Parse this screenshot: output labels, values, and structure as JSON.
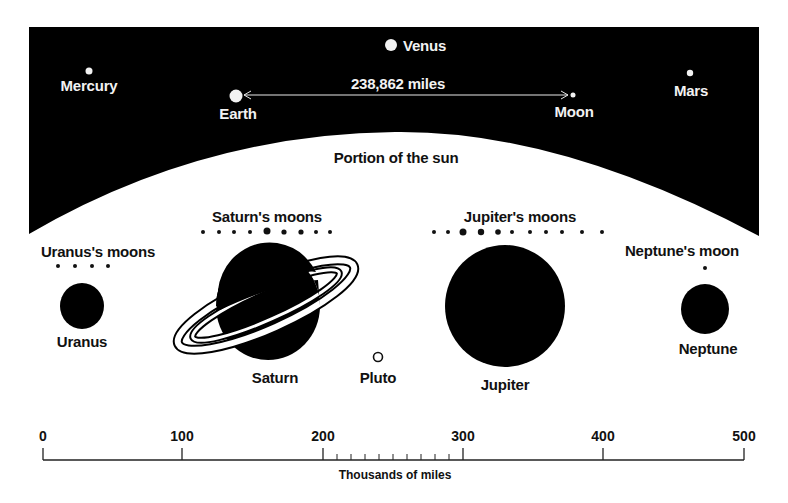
{
  "diagram": {
    "sky": {
      "label_sun": "Portion of the sun",
      "distance_label": "238,862 miles",
      "bodies": [
        {
          "name": "Mercury",
          "label": "Mercury"
        },
        {
          "name": "Venus",
          "label": "Venus"
        },
        {
          "name": "Earth",
          "label": "Earth"
        },
        {
          "name": "Moon",
          "label": "Moon"
        },
        {
          "name": "Mars",
          "label": "Mars"
        }
      ]
    },
    "outer": {
      "moon_groups": [
        {
          "label": "Uranus's moons",
          "count": 4
        },
        {
          "label": "Saturn's moons",
          "count": 9
        },
        {
          "label": "Jupiter's moons",
          "count": 11
        },
        {
          "label": "Neptune's moon",
          "count": 1
        }
      ],
      "planets": [
        {
          "name": "Uranus",
          "label": "Uranus"
        },
        {
          "name": "Saturn",
          "label": "Saturn"
        },
        {
          "name": "Pluto",
          "label": "Pluto"
        },
        {
          "name": "Jupiter",
          "label": "Jupiter"
        },
        {
          "name": "Neptune",
          "label": "Neptune"
        }
      ]
    },
    "scale": {
      "ticks": [
        "0",
        "100",
        "200",
        "300",
        "400",
        "500"
      ],
      "minor_ticks_between": [
        200,
        300
      ],
      "title": "Thousands of miles"
    },
    "colors": {
      "background": "#ffffff",
      "sky": "#000000",
      "ink": "#111111",
      "light_text": "#f2f2f2"
    }
  }
}
